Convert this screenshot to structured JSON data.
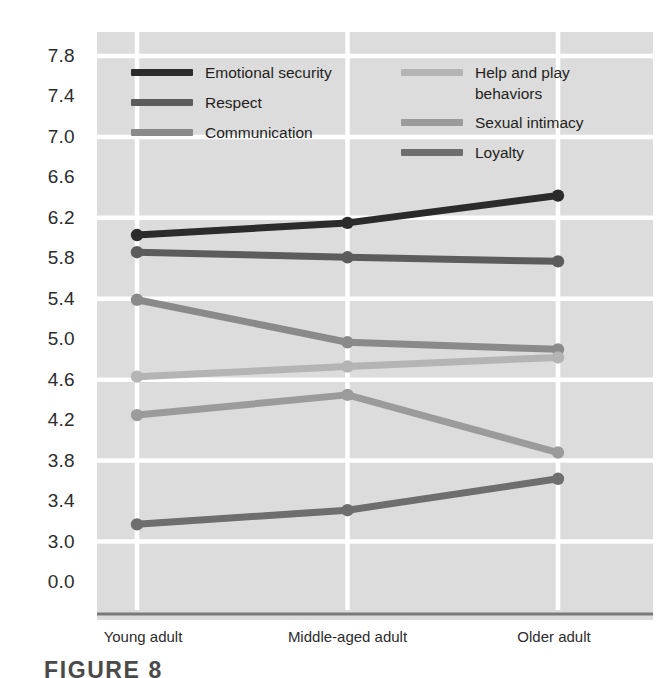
{
  "figure": {
    "caption": "FIGURE 8",
    "y_axis_title": "Rating scale"
  },
  "chart_data": {
    "type": "line",
    "title": "",
    "xlabel": "",
    "ylabel": "Rating scale",
    "categories": [
      "Young adult",
      "Middle-aged adult",
      "Older adult"
    ],
    "ytick_labels": [
      "7.8",
      "7.4",
      "7.0",
      "6.6",
      "6.2",
      "5.8",
      "5.4",
      "5.0",
      "4.6",
      "4.2",
      "3.8",
      "3.4",
      "3.0",
      "0.0"
    ],
    "ytick_values": [
      7.8,
      7.4,
      7.0,
      6.6,
      6.2,
      5.8,
      5.4,
      5.0,
      4.6,
      4.2,
      3.8,
      3.4,
      3.0,
      0.0
    ],
    "ylim": [
      0.0,
      7.8
    ],
    "axis_break": true,
    "axis_break_note": "Axis jumps from 3.0 to 0.0 at the bottom",
    "grid": true,
    "grid_color": "#ffffff",
    "plot_background": "#dcdcdc",
    "legend_position": "top-inside",
    "series": [
      {
        "name": "Emotional security",
        "color": "#2b2b2b",
        "values": [
          6.03,
          6.15,
          6.42
        ]
      },
      {
        "name": "Respect",
        "color": "#5c5c5c",
        "values": [
          5.86,
          5.81,
          5.77
        ]
      },
      {
        "name": "Communication",
        "color": "#8a8a8a",
        "values": [
          5.39,
          4.97,
          4.9
        ]
      },
      {
        "name": "Help and play behaviors",
        "color": "#b4b4b4",
        "values": [
          4.63,
          4.73,
          4.82
        ]
      },
      {
        "name": "Sexual intimacy",
        "color": "#9b9b9b",
        "values": [
          4.25,
          4.45,
          3.88
        ]
      },
      {
        "name": "Loyalty",
        "color": "#6e6e6e",
        "values": [
          3.17,
          3.31,
          3.62
        ]
      }
    ]
  },
  "legend": {
    "column_left": [
      {
        "label": "Emotional security",
        "color": "#2b2b2b"
      },
      {
        "label": "Respect",
        "color": "#5c5c5c"
      },
      {
        "label": "Communication",
        "color": "#8a8a8a"
      }
    ],
    "column_right": [
      {
        "label": "Help and play behaviors",
        "color": "#b4b4b4"
      },
      {
        "label": "Sexual intimacy",
        "color": "#9b9b9b"
      },
      {
        "label": "Loyalty",
        "color": "#6e6e6e"
      }
    ]
  }
}
